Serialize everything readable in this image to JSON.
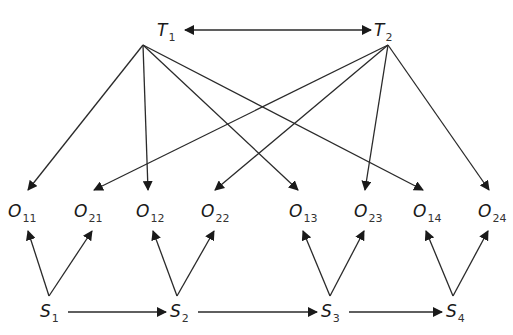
{
  "diagram": {
    "type": "directed-graph",
    "nodes": {
      "T1": {
        "base": "T",
        "sub": "1",
        "x": 157,
        "y": 22,
        "apex": [
          143,
          45
        ]
      },
      "T2": {
        "base": "T",
        "sub": "2",
        "x": 374,
        "y": 22,
        "apex": [
          388,
          45
        ]
      },
      "O11": {
        "base": "O",
        "sub": "11",
        "x": 8,
        "y": 203,
        "top": [
          28,
          190
        ],
        "bottom": [
          28,
          231
        ]
      },
      "O21": {
        "base": "O",
        "sub": "21",
        "x": 74,
        "y": 203,
        "top": [
          94,
          190
        ],
        "bottom": [
          92,
          231
        ]
      },
      "O12": {
        "base": "O",
        "sub": "12",
        "x": 136,
        "y": 203,
        "top": [
          148,
          190
        ],
        "bottom": [
          153,
          231
        ]
      },
      "O22": {
        "base": "O",
        "sub": "22",
        "x": 201,
        "y": 203,
        "top": [
          215,
          190
        ],
        "bottom": [
          214,
          231
        ]
      },
      "O13": {
        "base": "O",
        "sub": "13",
        "x": 289,
        "y": 203,
        "top": [
          298,
          190
        ],
        "bottom": [
          303,
          231
        ]
      },
      "O23": {
        "base": "O",
        "sub": "23",
        "x": 354,
        "y": 203,
        "top": [
          365,
          190
        ],
        "bottom": [
          364,
          231
        ]
      },
      "O14": {
        "base": "O",
        "sub": "14",
        "x": 413,
        "y": 203,
        "top": [
          423,
          190
        ],
        "bottom": [
          426,
          231
        ]
      },
      "O24": {
        "base": "O",
        "sub": "24",
        "x": 478,
        "y": 203,
        "top": [
          489,
          190
        ],
        "bottom": [
          488,
          231
        ]
      },
      "S1": {
        "base": "S",
        "sub": "1",
        "x": 40,
        "y": 303,
        "apex": [
          49,
          296
        ]
      },
      "S2": {
        "base": "S",
        "sub": "2",
        "x": 170,
        "y": 303,
        "apex": [
          177,
          296
        ]
      },
      "S3": {
        "base": "S",
        "sub": "3",
        "x": 321,
        "y": 303,
        "apex": [
          330,
          296
        ]
      },
      "S4": {
        "base": "S",
        "sub": "4",
        "x": 446,
        "y": 303,
        "apex": [
          453,
          296
        ]
      }
    },
    "edges": [
      {
        "from": "T1",
        "to": "T2",
        "kind": "bidirectional"
      },
      {
        "from": "T1",
        "to": "O11"
      },
      {
        "from": "T1",
        "to": "O12"
      },
      {
        "from": "T1",
        "to": "O13"
      },
      {
        "from": "T1",
        "to": "O14"
      },
      {
        "from": "T2",
        "to": "O21"
      },
      {
        "from": "T2",
        "to": "O22"
      },
      {
        "from": "T2",
        "to": "O23"
      },
      {
        "from": "T2",
        "to": "O24"
      },
      {
        "from": "S1",
        "to": "O11"
      },
      {
        "from": "S1",
        "to": "O21"
      },
      {
        "from": "S2",
        "to": "O12"
      },
      {
        "from": "S2",
        "to": "O22"
      },
      {
        "from": "S3",
        "to": "O13"
      },
      {
        "from": "S3",
        "to": "O23"
      },
      {
        "from": "S4",
        "to": "O14"
      },
      {
        "from": "S4",
        "to": "O24"
      },
      {
        "from": "S1",
        "to": "S2",
        "kind": "horizontal"
      },
      {
        "from": "S2",
        "to": "S3",
        "kind": "horizontal"
      },
      {
        "from": "S3",
        "to": "S4",
        "kind": "horizontal"
      }
    ],
    "style": {
      "line_color": "#2a2a2a",
      "text_color": "#1a1a1a"
    }
  },
  "caption": {
    "text": "",
    "note": "caption cut off at bottom edge"
  }
}
